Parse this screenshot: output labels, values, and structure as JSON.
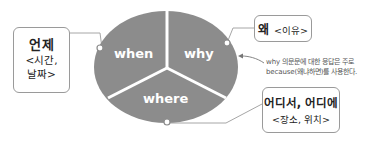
{
  "colors": {
    "ellipse_fill": "#8c8c8c",
    "divider": "#ffffff",
    "connector": "#a6a6a6",
    "box_border": "#9a9a9a",
    "segment_text": "#ffffff"
  },
  "ellipse": {
    "segments": [
      {
        "id": "when",
        "label": "when"
      },
      {
        "id": "why",
        "label": "why"
      },
      {
        "id": "where",
        "label": "where"
      }
    ]
  },
  "boxes": {
    "when": {
      "title": "언제",
      "sub_line1": "<시간,",
      "sub_line2": "날짜>"
    },
    "why": {
      "title": "왜",
      "sub": "<이유>"
    },
    "where": {
      "title": "어디서, 어디에",
      "sub": "<장소, 위치>"
    }
  },
  "note": {
    "line1": "why 의문문에 대한 응답은 주로",
    "line2": "because(왜냐하면)를 사용한다."
  }
}
